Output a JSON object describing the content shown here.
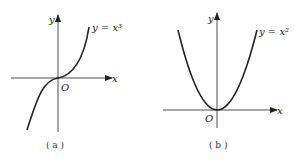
{
  "panels": [
    {
      "id": "a",
      "caption": "( a )",
      "curve_label": "y = x³",
      "x_axis_label": "x",
      "y_axis_label": "y",
      "origin_label": "O",
      "function": "x^3"
    },
    {
      "id": "b",
      "caption": "( b )",
      "curve_label": "y = x²",
      "x_axis_label": "x",
      "y_axis_label": "y",
      "origin_label": "O",
      "function": "x^2"
    }
  ],
  "colors": {
    "stroke": "#222222",
    "background": "#ffffff"
  }
}
